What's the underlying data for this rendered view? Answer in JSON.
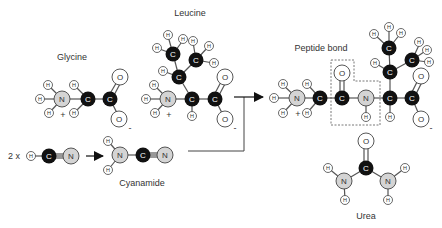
{
  "labels": {
    "glycine": "Glycine",
    "leucine": "Leucine",
    "peptide_bond": "Peptide bond",
    "cyanamide": "Cyanamide",
    "urea": "Urea",
    "multiplier": "2 x"
  },
  "charges": {
    "plus": "+",
    "minus": "-"
  },
  "elements": {
    "H": "H",
    "C": "C",
    "N": "N",
    "O": "O"
  },
  "colors": {
    "carbon_fill": "#111111",
    "nitrogen_fill": "#d4d4d4",
    "oxygen_fill": "#ffffff",
    "hydrogen_fill": "#ffffff",
    "outline": "#444444",
    "bond": "#555555",
    "dashed_box": "#555555"
  }
}
